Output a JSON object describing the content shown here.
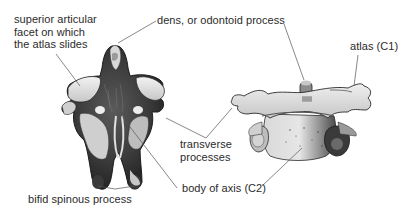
{
  "diagram": {
    "views": [
      {
        "name": "axis-posterior-superior-view",
        "position": "left"
      },
      {
        "name": "atlas-on-axis-anterior-view",
        "position": "right"
      }
    ]
  },
  "labels": {
    "superior_facet": {
      "lines": [
        "superior articular",
        "facet on which",
        "the atlas slides"
      ]
    },
    "dens": {
      "text": "dens, or odontoid process"
    },
    "atlas": {
      "text": "atlas (C1)"
    },
    "transverse": {
      "lines": [
        "transverse",
        "processes"
      ]
    },
    "body_axis": {
      "text": "body of axis (C2)"
    },
    "bifid": {
      "text": "bifid spinous process"
    }
  },
  "colors": {
    "background": "#ffffff",
    "text": "#2b2b2b",
    "leader_line": "#555555",
    "bone_light": "#e6e6e6",
    "bone_mid": "#a8a8a8",
    "bone_dark": "#2e2e2e"
  }
}
